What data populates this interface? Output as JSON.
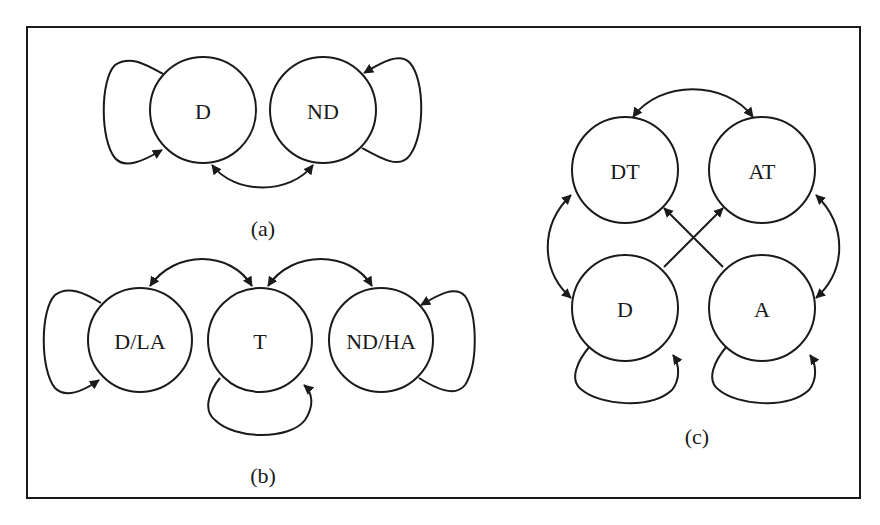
{
  "figure": {
    "border_color": "#1a1a1a",
    "background": "#ffffff"
  },
  "diagrams": {
    "a": {
      "caption": "(a)",
      "nodes": [
        {
          "id": "D",
          "label": "D"
        },
        {
          "id": "ND",
          "label": "ND"
        }
      ],
      "edges": [
        {
          "from": "D",
          "to": "D",
          "type": "self-loop"
        },
        {
          "from": "ND",
          "to": "ND",
          "type": "self-loop"
        },
        {
          "from": "D",
          "to": "ND",
          "type": "bidirectional"
        }
      ]
    },
    "b": {
      "caption": "(b)",
      "nodes": [
        {
          "id": "D/LA",
          "label": "D/LA"
        },
        {
          "id": "T",
          "label": "T"
        },
        {
          "id": "ND/HA",
          "label": "ND/HA"
        }
      ],
      "edges": [
        {
          "from": "D/LA",
          "to": "D/LA",
          "type": "self-loop"
        },
        {
          "from": "T",
          "to": "T",
          "type": "self-loop"
        },
        {
          "from": "ND/HA",
          "to": "ND/HA",
          "type": "self-loop"
        },
        {
          "from": "D/LA",
          "to": "T",
          "type": "bidirectional"
        },
        {
          "from": "T",
          "to": "ND/HA",
          "type": "bidirectional"
        }
      ]
    },
    "c": {
      "caption": "(c)",
      "nodes": [
        {
          "id": "DT",
          "label": "DT"
        },
        {
          "id": "AT",
          "label": "AT"
        },
        {
          "id": "D",
          "label": "D"
        },
        {
          "id": "A",
          "label": "A"
        }
      ],
      "edges": [
        {
          "from": "DT",
          "to": "AT",
          "type": "bidirectional"
        },
        {
          "from": "DT",
          "to": "D",
          "type": "bidirectional"
        },
        {
          "from": "AT",
          "to": "A",
          "type": "bidirectional"
        },
        {
          "from": "D",
          "to": "AT",
          "type": "directed"
        },
        {
          "from": "A",
          "to": "DT",
          "type": "directed"
        },
        {
          "from": "D",
          "to": "D",
          "type": "self-loop"
        },
        {
          "from": "A",
          "to": "A",
          "type": "self-loop"
        }
      ]
    }
  }
}
